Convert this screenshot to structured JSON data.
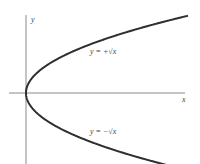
{
  "diagram": {
    "title": "",
    "axes": {
      "x_label": "x",
      "y_label": "y"
    },
    "curves": [
      {
        "name": "upper-branch",
        "equation_label": "y = +√x",
        "expression": "y = +sqrt(x)"
      },
      {
        "name": "lower-branch",
        "equation_label": "y = −√x",
        "expression": "y = -sqrt(x)"
      }
    ],
    "colors": {
      "curve": "#2f2f2f",
      "axis": "#8a8a8a",
      "text": "#444444"
    }
  }
}
